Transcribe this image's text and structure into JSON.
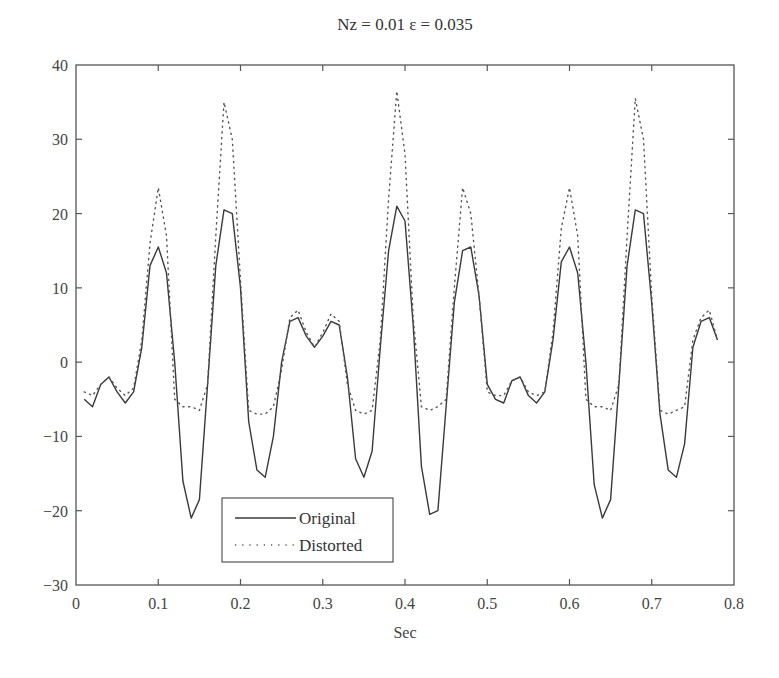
{
  "chart_data": {
    "type": "line",
    "title": "Nz = 0.01 ε = 0.035",
    "xlabel": "Sec",
    "ylabel": "",
    "xlim": [
      0,
      0.8
    ],
    "ylim": [
      -30,
      40
    ],
    "xticks": [
      "0",
      "0.1",
      "0.2",
      "0.3",
      "0.4",
      "0.5",
      "0.6",
      "0.7",
      "0.8"
    ],
    "yticks": [
      "40",
      "30",
      "20",
      "10",
      "0",
      "−10",
      "−20",
      "−30"
    ],
    "grid": false,
    "legend_position": "lower-left (inside)",
    "x": [
      0.01,
      0.02,
      0.03,
      0.04,
      0.05,
      0.06,
      0.07,
      0.08,
      0.09,
      0.1,
      0.11,
      0.12,
      0.13,
      0.14,
      0.15,
      0.16,
      0.17,
      0.18,
      0.19,
      0.2,
      0.21,
      0.22,
      0.23,
      0.24,
      0.25,
      0.26,
      0.27,
      0.28,
      0.29,
      0.3,
      0.31,
      0.32,
      0.33,
      0.34,
      0.35,
      0.36,
      0.37,
      0.38,
      0.39,
      0.4,
      0.41,
      0.42,
      0.43,
      0.44,
      0.45,
      0.46,
      0.47,
      0.48,
      0.49,
      0.5,
      0.51,
      0.52,
      0.53,
      0.54,
      0.55,
      0.56,
      0.57,
      0.58,
      0.59,
      0.6,
      0.61,
      0.62,
      0.63,
      0.64,
      0.65,
      0.66,
      0.67,
      0.68,
      0.69,
      0.7,
      0.71,
      0.72,
      0.73,
      0.74,
      0.75,
      0.76,
      0.77,
      0.78
    ],
    "series": [
      {
        "name": "Original",
        "style": "solid",
        "values": [
          -5,
          -6,
          -3,
          -2,
          -4,
          -5.5,
          -4,
          2,
          13,
          15.5,
          12,
          0,
          -16,
          -21,
          -18.5,
          -3,
          13,
          20.5,
          20,
          10,
          -8,
          -14.5,
          -15.5,
          -10,
          0,
          5.5,
          6,
          3.5,
          2,
          3.5,
          5.5,
          5,
          -2,
          -13,
          -15.5,
          -12,
          2,
          15,
          21,
          19,
          5,
          -14,
          -20.5,
          -20,
          -6,
          8,
          15,
          15.5,
          9,
          -3,
          -5,
          -5.5,
          -2.5,
          -2,
          -4.5,
          -5.5,
          -4,
          3,
          13.5,
          15.5,
          12,
          0,
          -16.5,
          -21,
          -18.5,
          -3,
          13,
          20.5,
          20,
          8,
          -7,
          -14.5,
          -15.5,
          -11,
          2,
          5.5,
          6,
          3
        ]
      },
      {
        "name": "Distorted",
        "style": "dotted",
        "values": [
          -4,
          -4.5,
          -3,
          -2,
          -3.5,
          -4.5,
          -3.5,
          3,
          16,
          23.5,
          17,
          -5,
          -6,
          -6,
          -6.5,
          -3,
          17,
          35,
          30,
          11,
          -6.5,
          -7,
          -7,
          -6,
          -1,
          6,
          7,
          4,
          2,
          4,
          6.5,
          5.5,
          -3,
          -6.5,
          -7,
          -6.5,
          3,
          22,
          36.5,
          28,
          6,
          -6,
          -6.5,
          -6,
          -5,
          10,
          23.5,
          20,
          9,
          -4,
          -4.5,
          -4.5,
          -2.5,
          -2,
          -4,
          -4.5,
          -4,
          4,
          18,
          23.5,
          17,
          -5,
          -6,
          -6,
          -6.5,
          -3,
          17,
          35.5,
          30,
          9,
          -6.5,
          -7,
          -6.5,
          -6,
          3,
          6,
          7,
          3
        ]
      }
    ]
  },
  "legend": {
    "items": [
      {
        "label": "Original",
        "style": "solid"
      },
      {
        "label": "Distorted",
        "style": "dotted"
      }
    ]
  },
  "colors": {
    "line": "#3a3a3a",
    "axis": "#555555",
    "text": "#333333"
  }
}
